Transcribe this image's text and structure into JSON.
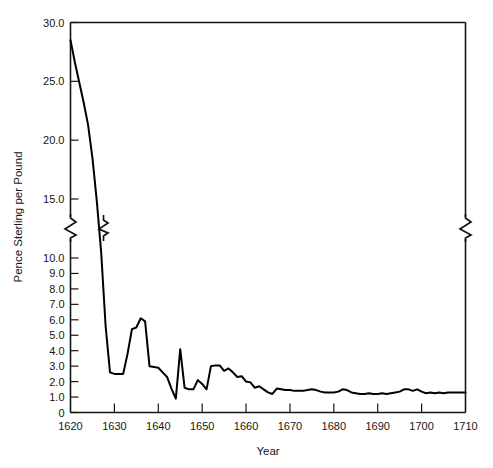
{
  "chart_data": {
    "type": "line",
    "title": "",
    "xlabel": "Year",
    "ylabel": "Pence Sterling per Pound",
    "xlim": [
      1620,
      1710
    ],
    "ylim": [
      0,
      30
    ],
    "grid": false,
    "legend": null,
    "axis_break": {
      "present": true,
      "between": [
        10.0,
        15.0
      ],
      "note": "y-axis compressed between 10.0 and 15.0; break glyphs drawn on left and right frame"
    },
    "xticks": [
      1620,
      1630,
      1640,
      1650,
      1660,
      1670,
      1680,
      1690,
      1700,
      1710
    ],
    "xtick_labels": [
      "1620",
      "1630",
      "1640",
      "1650",
      "1660",
      "1670",
      "1680",
      "1690",
      "1700",
      "1710"
    ],
    "yticks": [
      0,
      1.0,
      2.0,
      3.0,
      4.0,
      5.0,
      6.0,
      7.0,
      8.0,
      9.0,
      10.0,
      15.0,
      20.0,
      25.0,
      30.0
    ],
    "ytick_labels": [
      "0",
      "1.0",
      "2.0",
      "3.0",
      "4.0",
      "5.0",
      "6.0",
      "7.0",
      "8.0",
      "9.0",
      "10.0",
      "15.0",
      "20.0",
      "25.0",
      "30.0"
    ],
    "series": [
      {
        "name": "Tobacco price",
        "color": "#000000",
        "x": [
          1620,
          1621,
          1622,
          1623,
          1624,
          1625,
          1626,
          1627,
          1628,
          1629,
          1630,
          1631,
          1632,
          1633,
          1634,
          1635,
          1636,
          1637,
          1638,
          1639,
          1640,
          1641,
          1642,
          1643,
          1644,
          1645,
          1646,
          1647,
          1648,
          1649,
          1650,
          1651,
          1652,
          1653,
          1654,
          1655,
          1656,
          1657,
          1658,
          1659,
          1660,
          1661,
          1662,
          1663,
          1664,
          1665,
          1666,
          1667,
          1668,
          1669,
          1670,
          1671,
          1672,
          1673,
          1674,
          1675,
          1676,
          1677,
          1678,
          1679,
          1680,
          1681,
          1682,
          1683,
          1684,
          1685,
          1686,
          1687,
          1688,
          1689,
          1690,
          1691,
          1692,
          1693,
          1694,
          1695,
          1696,
          1697,
          1698,
          1699,
          1700,
          1701,
          1702,
          1703,
          1704,
          1705,
          1706,
          1707,
          1708,
          1709,
          1710
        ],
        "y": [
          28.5,
          26.6,
          24.9,
          23.2,
          21.3,
          18.5,
          14.8,
          10.4,
          5.6,
          2.6,
          2.5,
          2.5,
          2.5,
          3.8,
          5.4,
          5.5,
          6.1,
          5.9,
          3.0,
          2.95,
          2.9,
          2.6,
          2.3,
          1.55,
          0.9,
          4.1,
          1.6,
          1.5,
          1.5,
          2.1,
          1.85,
          1.5,
          3.0,
          3.05,
          3.05,
          2.7,
          2.85,
          2.6,
          2.3,
          2.35,
          2.0,
          1.95,
          1.6,
          1.7,
          1.5,
          1.3,
          1.2,
          1.55,
          1.5,
          1.45,
          1.45,
          1.4,
          1.4,
          1.4,
          1.45,
          1.5,
          1.45,
          1.35,
          1.3,
          1.3,
          1.3,
          1.35,
          1.5,
          1.45,
          1.3,
          1.25,
          1.2,
          1.2,
          1.25,
          1.2,
          1.2,
          1.25,
          1.2,
          1.25,
          1.3,
          1.35,
          1.5,
          1.5,
          1.4,
          1.5,
          1.35,
          1.25,
          1.3,
          1.25,
          1.3,
          1.25,
          1.3,
          1.3,
          1.3,
          1.3,
          1.3
        ]
      }
    ]
  },
  "axes": {
    "x_title": "Year",
    "y_title": "Pence Sterling per Pound"
  },
  "colors": {
    "line": "#000000",
    "frame": "#141414",
    "text": "#161616",
    "background": "#ffffff"
  }
}
